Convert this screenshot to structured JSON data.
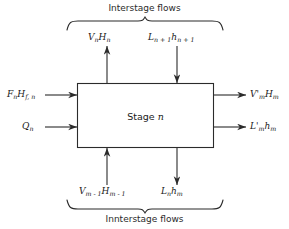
{
  "diagram": {
    "title_top": "Interstage flows",
    "title_bottom": "Innterstage flows",
    "box": {
      "label_prefix": "Stage",
      "label_subject": "n"
    },
    "flows": {
      "top_left_out": {
        "main1": "V",
        "sub1": "n",
        "main2": "H",
        "sub2": "n"
      },
      "top_right_in": {
        "main1": "L",
        "sub1": "n + 1",
        "main2": "h",
        "sub2": "n + 1"
      },
      "left_in_upper": {
        "main1": "F",
        "sub1": "n",
        "main2": "H",
        "sub2": "f, n"
      },
      "left_in_lower": {
        "main1": "Q",
        "sub1": "n"
      },
      "right_out_upper": {
        "main1": "V",
        "prime": "'",
        "sub1": "m",
        "main2": "H",
        "sub2": "m"
      },
      "right_out_lower": {
        "main1": "L",
        "prime": "'",
        "sub1": "m",
        "main2": "h",
        "sub2": "m"
      },
      "bottom_left_in": {
        "main1": "V",
        "sub1": "m - 1",
        "main2": "H",
        "sub2": "m - 1"
      },
      "bottom_right_out": {
        "main1": "L",
        "sub1": "n",
        "main2": "h",
        "sub2": "m"
      }
    },
    "colors": {
      "stroke": "#2b2b2b",
      "text": "#1a1a1a",
      "background": "#ffffff"
    }
  }
}
